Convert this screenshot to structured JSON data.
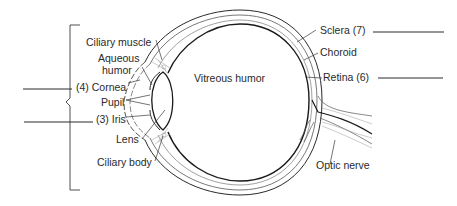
{
  "diagram": {
    "labels": {
      "ciliary_muscle": "Ciliary muscle",
      "aqueous_humor_line1": "Aqueous",
      "aqueous_humor_line2": "humor",
      "cornea": "(4) Cornea",
      "pupil": "Pupil",
      "iris": "(3) Iris",
      "lens": "Lens",
      "ciliary_body": "Ciliary body",
      "vitreous_humor": "Vitreous humor",
      "sclera": "Sclera (7)",
      "choroid": "Choroid",
      "retina": "Retina (6)",
      "optic_nerve": "Optic nerve"
    },
    "answer_blanks": [
      {
        "id": "blank-left-upper",
        "value": ""
      },
      {
        "id": "blank-left-lower",
        "value": ""
      },
      {
        "id": "blank-right-sclera",
        "value": ""
      },
      {
        "id": "blank-right-retina",
        "value": ""
      }
    ],
    "colors": {
      "line": "#2a2a2a",
      "light_line": "#9a9a9a",
      "background": "#ffffff"
    }
  }
}
